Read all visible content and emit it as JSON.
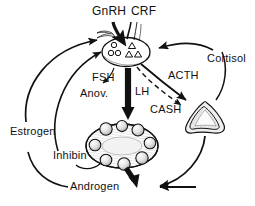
{
  "figure": {
    "background_color": "#ffffff",
    "ink_color": "#111111"
  },
  "labels": {
    "gnrh": "GnRH",
    "crf": "CRF",
    "fsh": "FSH",
    "anov": "Anov.",
    "lh": "LH",
    "acth": "ACTH",
    "cash": "CASH",
    "cortisol": "Cortisol",
    "estrogen": "Estrogen",
    "inhibin": "Inhibin",
    "androgen": "Androgen"
  },
  "organs": {
    "pituitary": {
      "name": "pituitary-gland",
      "gonadotrope_circles": 3,
      "corticotrope_triangles": 3
    },
    "ovary": {
      "name": "polycystic-ovary",
      "follicles": 8
    },
    "adrenal": {
      "name": "adrenal-gland",
      "shape": "triangular"
    }
  },
  "connections": [
    {
      "from": "GnRH",
      "to": "pituitary",
      "style": "solid-thick"
    },
    {
      "from": "CRF",
      "to": "pituitary",
      "style": "thin"
    },
    {
      "from": "pituitary",
      "to": "Anov.",
      "label": "FSH",
      "style": "solid-thin"
    },
    {
      "from": "pituitary",
      "to": "ovary",
      "label": "LH",
      "style": "solid-thick"
    },
    {
      "from": "pituitary",
      "to": "adrenal",
      "label": "ACTH",
      "style": "solid"
    },
    {
      "from": "pituitary",
      "to": "adrenal",
      "label": "CASH",
      "style": "dashed"
    },
    {
      "from": "Cortisol",
      "to": "pituitary",
      "style": "solid"
    },
    {
      "from": "adrenal",
      "to": "Cortisol",
      "style": "solid"
    },
    {
      "from": "ovary",
      "to": "Androgen",
      "style": "solid-thick"
    },
    {
      "from": "adrenal",
      "to": "Androgen",
      "style": "solid"
    },
    {
      "from": "Androgen",
      "to": "Estrogen",
      "style": "solid"
    },
    {
      "from": "Estrogen",
      "to": "pituitary",
      "style": "solid"
    },
    {
      "from": "Inhibin",
      "to": "pituitary",
      "style": "solid"
    },
    {
      "from": "ovary",
      "to": "Inhibin",
      "style": "solid"
    }
  ]
}
